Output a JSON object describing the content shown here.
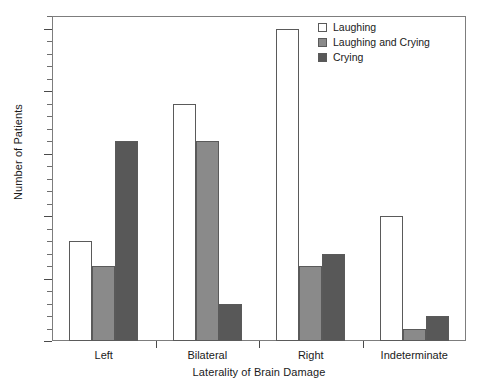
{
  "chart_data": {
    "type": "bar",
    "title": "",
    "xlabel": "Laterality of Brain Damage",
    "ylabel": "Number of Patients",
    "categories": [
      "Left",
      "Bilateral",
      "Right",
      "Indeterminate"
    ],
    "series": [
      {
        "name": "Laughing",
        "color": "#ffffff",
        "values": [
          8,
          19,
          25,
          10
        ]
      },
      {
        "name": "Laughing and Crying",
        "color": "#8a8a8a",
        "values": [
          6,
          16,
          6,
          1
        ]
      },
      {
        "name": "Crying",
        "color": "#585858",
        "values": [
          16,
          3,
          7,
          2
        ]
      }
    ],
    "ylim": [
      0,
      26
    ],
    "y_major_ticks": [
      0,
      5,
      10,
      15,
      20,
      25
    ],
    "y_minor_tick_step": 1,
    "y_tick_labels": [
      "0",
      "5",
      "10",
      "15",
      "20",
      "25"
    ],
    "grid": false,
    "legend_position": "top-right",
    "bar_edge_color": "#5a5a5a",
    "frame_color": "#7d7d7d"
  }
}
